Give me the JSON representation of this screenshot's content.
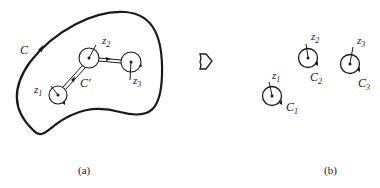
{
  "panel_a": {
    "caption": "(a)",
    "outer_contour_label": "C",
    "inner_contour_label": "C′",
    "points": [
      {
        "name": "z",
        "sub": "1"
      },
      {
        "name": "z",
        "sub": "2"
      },
      {
        "name": "z",
        "sub": "3"
      }
    ]
  },
  "arrow": {
    "icon": "hollow-right-arrow-icon"
  },
  "panel_b": {
    "caption": "(b)",
    "points": [
      {
        "name": "z",
        "sub": "1",
        "contour": "C",
        "contour_sub": "1"
      },
      {
        "name": "z",
        "sub": "2",
        "contour": "C",
        "contour_sub": "2"
      },
      {
        "name": "z",
        "sub": "3",
        "contour": "C",
        "contour_sub": "3"
      }
    ]
  },
  "colors": {
    "stroke": "#1a1a1a",
    "background": "#ffffff"
  }
}
